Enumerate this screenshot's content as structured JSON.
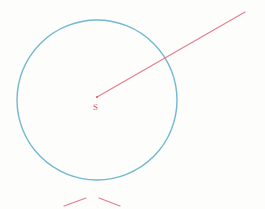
{
  "figure": {
    "background_color": "#fdfdfc",
    "width": 265,
    "height": 209
  },
  "circle": {
    "name": "main-circle",
    "center_x": 97,
    "center_y": 100,
    "radius": 80,
    "stroke_color": "#5bacc8",
    "stroke_width": 1.4
  },
  "center_point": {
    "label": "S",
    "label_color": "#d4566a",
    "x": 97,
    "y": 97,
    "label_x": 93,
    "label_y": 104,
    "dot_radius": 1.1,
    "dot_color": "#d4566a"
  },
  "ray": {
    "name": "radius-ray",
    "x1": 97,
    "y1": 97,
    "x2": 245,
    "y2": 12,
    "stroke_color": "#e0687c",
    "stroke_width": 1.1
  },
  "intersection": {
    "x": 170,
    "y": 58,
    "visible": false
  },
  "construction_marks": [
    {
      "name": "arc-mark-left",
      "x1": 64,
      "y1": 206,
      "x2": 86,
      "y2": 198,
      "stroke_color": "#e0687c",
      "stroke_width": 1.2
    },
    {
      "name": "arc-mark-right",
      "x1": 99,
      "y1": 198,
      "x2": 120,
      "y2": 206,
      "stroke_color": "#e0687c",
      "stroke_width": 1.2
    }
  ]
}
